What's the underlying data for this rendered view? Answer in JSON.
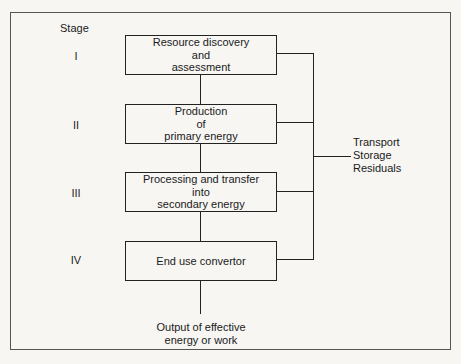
{
  "diagram": {
    "stage_header": "Stage",
    "stages": [
      {
        "numeral": "I",
        "label": "Resource discovery\nand\nassessment"
      },
      {
        "numeral": "II",
        "label": "Production\nof\nprimary energy"
      },
      {
        "numeral": "III",
        "label": "Processing and transfer\ninto\nsecondary energy"
      },
      {
        "numeral": "IV",
        "label": "End use convertor"
      }
    ],
    "side_label": "Transport\nStorage\nResiduals",
    "output_label": "Output of effective\nenergy or work"
  }
}
